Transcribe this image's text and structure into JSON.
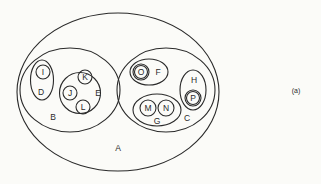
{
  "diagram": {
    "type": "nested-set-diagram",
    "caption": "(a)",
    "colors": {
      "background": "#fbfbf8",
      "stroke": "#2a2a2a"
    },
    "sets": [
      {
        "id": "A",
        "label": "A",
        "parent": null
      },
      {
        "id": "B",
        "label": "B",
        "parent": "A"
      },
      {
        "id": "C",
        "label": "C",
        "parent": "A"
      },
      {
        "id": "D",
        "label": "D",
        "parent": "B"
      },
      {
        "id": "E",
        "label": "E",
        "parent": "B"
      },
      {
        "id": "I",
        "label": "I",
        "parent": "D"
      },
      {
        "id": "J",
        "label": "J",
        "parent": "E"
      },
      {
        "id": "K",
        "label": "K",
        "parent": "E"
      },
      {
        "id": "L",
        "label": "L",
        "parent": "E"
      },
      {
        "id": "F",
        "label": "F",
        "parent": "C"
      },
      {
        "id": "G",
        "label": "G",
        "parent": "C"
      },
      {
        "id": "H",
        "label": "H",
        "parent": "C"
      },
      {
        "id": "O",
        "label": "O",
        "parent": "F"
      },
      {
        "id": "M",
        "label": "M",
        "parent": "G"
      },
      {
        "id": "N",
        "label": "N",
        "parent": "G"
      },
      {
        "id": "P",
        "label": "P",
        "parent": "H"
      }
    ],
    "labels": {
      "A": "A",
      "B": "B",
      "C": "C",
      "D": "D",
      "E": "E",
      "F": "F",
      "G": "G",
      "H": "H",
      "I": "I",
      "J": "J",
      "K": "K",
      "L": "L",
      "M": "M",
      "N": "N",
      "O": "O",
      "P": "P"
    }
  }
}
